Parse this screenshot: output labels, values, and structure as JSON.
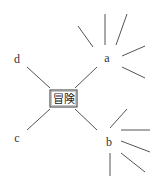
{
  "diagram": {
    "type": "mind-map",
    "center": {
      "label": "冒険"
    },
    "nodes": [
      {
        "id": "a",
        "label": "a",
        "rays": 5
      },
      {
        "id": "b",
        "label": "b",
        "rays": 5
      },
      {
        "id": "c",
        "label": "c",
        "rays": 0
      },
      {
        "id": "d",
        "label": "d",
        "rays": 0
      }
    ],
    "colors": {
      "line": "#444444",
      "text": "#333333",
      "background": "#ffffff"
    }
  }
}
